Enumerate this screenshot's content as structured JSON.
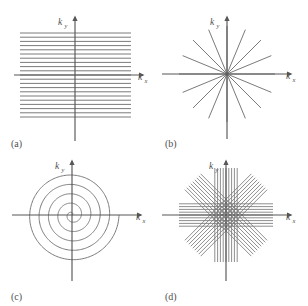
{
  "figure": {
    "background_color": "#ffffff",
    "axis_color": "#575757",
    "trace_color": "#7a7a7a",
    "label_color": "#4f4f4f",
    "axis_labels": {
      "x_symbol": "k",
      "x_subscript": "x",
      "y_symbol": "k",
      "y_subscript": "y"
    }
  },
  "panels": [
    {
      "id": "a",
      "label": "(a)",
      "name": "cartesian-rectilinear-trajectory",
      "trajectory_type": "cartesian",
      "grid_position": {
        "row": 0,
        "col": 0
      },
      "origin": {
        "x": 75,
        "y": 75
      },
      "axis_x_span": [
        14,
        143
      ],
      "axis_y_span": [
        17,
        141
      ],
      "line_count": 21,
      "line_x_start": 20,
      "line_x_end": 131,
      "line_y_top": 33,
      "line_y_bottom": 117,
      "line_spacing": 4.2
    },
    {
      "id": "b",
      "label": "(b)",
      "name": "radial-spoke-trajectory",
      "trajectory_type": "radial",
      "grid_position": {
        "row": 0,
        "col": 1
      },
      "origin": {
        "x": 73,
        "y": 74
      },
      "axis_x_span": [
        8,
        137
      ],
      "axis_y_span": [
        17,
        139
      ],
      "spoke_count": 16,
      "spoke_radius": 48,
      "spoke_angle_step_deg": 22.5
    },
    {
      "id": "c",
      "label": "(c)",
      "name": "spiral-trajectory",
      "trajectory_type": "spiral",
      "grid_position": {
        "row": 1,
        "col": 0
      },
      "origin": {
        "x": 72,
        "y": 62
      },
      "axis_x_span": [
        12,
        141
      ],
      "axis_y_span": [
        8,
        128
      ],
      "spiral_turns": 5,
      "spiral_max_radius": 47,
      "spiral_start_angle_deg": 0
    },
    {
      "id": "d",
      "label": "(d)",
      "name": "propeller-blade-trajectory",
      "trajectory_type": "propeller",
      "grid_position": {
        "row": 1,
        "col": 1
      },
      "origin": {
        "x": 72,
        "y": 62
      },
      "axis_x_span": [
        8,
        137
      ],
      "axis_y_span": [
        8,
        128
      ],
      "blade_count": 4,
      "blade_angles_deg": [
        0,
        45,
        90,
        135
      ],
      "lines_per_blade": 9,
      "blade_half_length": 47,
      "blade_line_spacing": 2.8
    }
  ]
}
